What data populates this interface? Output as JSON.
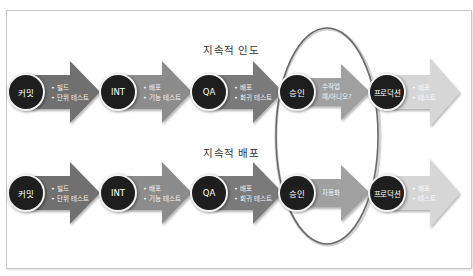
{
  "rows": [
    {
      "title": "지속적 인도",
      "stages": [
        {
          "label": "커밋",
          "items": [
            "빌드",
            "단위 테스트"
          ]
        },
        {
          "label": "INT",
          "items": [
            "배포",
            "기능 테스트"
          ]
        },
        {
          "label": "QA",
          "items": [
            "배포",
            "회귀 테스트"
          ]
        },
        {
          "label": "승인",
          "items_plain": [
            "수작업",
            "예/아니오?"
          ]
        },
        {
          "label": "프로덕션",
          "items": [
            "배포",
            "테스트"
          ]
        }
      ]
    },
    {
      "title": "지속적 배포",
      "stages": [
        {
          "label": "커밋",
          "items": [
            "빌드",
            "단위 테스트"
          ]
        },
        {
          "label": "INT",
          "items": [
            "배포",
            "기능 테스트"
          ]
        },
        {
          "label": "QA",
          "items": [
            "배포",
            "회귀 테스트"
          ]
        },
        {
          "label": "승인",
          "items_plain": [
            "자동화"
          ]
        },
        {
          "label": "프로덕션",
          "items": [
            "배포",
            "테스트"
          ]
        }
      ]
    }
  ],
  "colors": {
    "circle": "#1e1e1e",
    "arrow_commit": "#6f6f6f",
    "arrow_int": "#8c8c8c",
    "arrow_qa": "#7a7a7a",
    "arrow_approval": "#a0a0a0",
    "arrow_production": "#d6d6d6",
    "highlight_ellipse": "#6a6a6a"
  }
}
